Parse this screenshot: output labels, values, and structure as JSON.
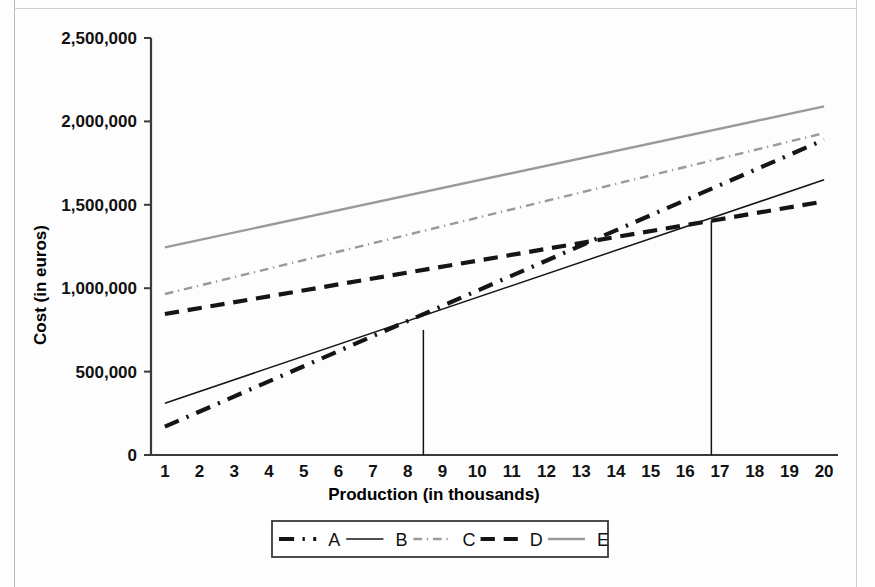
{
  "chart_data": {
    "type": "line",
    "title": "",
    "xlabel": "Production (in thousands)",
    "ylabel": "Cost (in euros)",
    "xlim": [
      0.6,
      20.4
    ],
    "ylim": [
      0,
      2500000
    ],
    "grid": false,
    "legend_position": "bottom",
    "x": [
      1,
      20
    ],
    "xtick_labels": [
      "1",
      "2",
      "3",
      "4",
      "5",
      "6",
      "7",
      "8",
      "9",
      "10",
      "11",
      "12",
      "13",
      "14",
      "15",
      "16",
      "17",
      "18",
      "19",
      "20"
    ],
    "ytick_labels": [
      "0",
      "500,000",
      "1,000,000",
      "1,500,000",
      "2,000,000",
      "2,500,000"
    ],
    "ytick_values": [
      0,
      500000,
      1000000,
      1500000,
      2000000,
      2500000
    ],
    "series": [
      {
        "name": "A",
        "style": "dash-dot",
        "weight": "thick",
        "color": "#151515",
        "x": [
          1,
          20
        ],
        "values": [
          170000,
          1890000
        ]
      },
      {
        "name": "B",
        "style": "solid",
        "weight": "thin",
        "color": "#151515",
        "x": [
          1,
          20
        ],
        "values": [
          310000,
          1650000
        ]
      },
      {
        "name": "C",
        "style": "dash-dot",
        "weight": "medium",
        "color": "#9a9a9a",
        "x": [
          1,
          20
        ],
        "values": [
          965000,
          1930000
        ]
      },
      {
        "name": "D",
        "style": "dashed",
        "weight": "thick",
        "color": "#151515",
        "x": [
          1,
          20
        ],
        "values": [
          845000,
          1520000
        ]
      },
      {
        "name": "E",
        "style": "solid",
        "weight": "medium",
        "color": "#9a9a9a",
        "x": [
          1,
          20
        ],
        "values": [
          1245000,
          2090000
        ]
      }
    ],
    "annotations": [
      {
        "name": "intersection-A-B",
        "type": "vertical-line",
        "x": 8.45,
        "y_top": 750000,
        "y_bottom": 0
      },
      {
        "name": "intersection-B-D",
        "type": "vertical-line",
        "x": 16.75,
        "y_top": 1405000,
        "y_bottom": 0
      }
    ]
  },
  "axes": {
    "y_title": "Cost (in euros)",
    "x_title": "Production (in thousands)",
    "y_ticks": [
      "2,500,000",
      "2,000,000",
      "1,500,000",
      "1,000,000",
      "500,000",
      "0"
    ],
    "x_ticks": [
      "1",
      "2",
      "3",
      "4",
      "5",
      "6",
      "7",
      "8",
      "9",
      "10",
      "11",
      "12",
      "13",
      "14",
      "15",
      "16",
      "17",
      "18",
      "19",
      "20"
    ]
  },
  "legend": {
    "items": [
      {
        "label": "A"
      },
      {
        "label": "B"
      },
      {
        "label": "C"
      },
      {
        "label": "D"
      },
      {
        "label": "E"
      }
    ]
  },
  "colors": {
    "ink": "#151515",
    "grey_line": "#9a9a9a",
    "frame": "#3a3a3a",
    "page": "#fdfdfd"
  }
}
